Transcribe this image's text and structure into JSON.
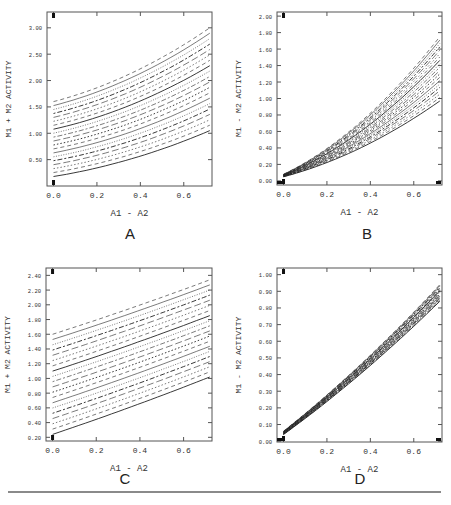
{
  "figure": {
    "panels": [
      "A",
      "B",
      "C",
      "D"
    ]
  },
  "chart_data": [
    {
      "id": "A",
      "type": "line",
      "title": "A",
      "xlabel": "A1 - A2",
      "ylabel": "M1 + M2 ACTIVITY",
      "xlim": [
        -0.03,
        0.73
      ],
      "ylim": [
        0.0,
        3.3
      ],
      "xticks": [
        0.0,
        0.2,
        0.4,
        0.6
      ],
      "xtick_labels": [
        "0.0",
        "0.2",
        "0.4",
        "0.6"
      ],
      "yticks": [
        0.5,
        1.0,
        1.5,
        2.0,
        2.5,
        3.0
      ],
      "ytick_labels": [
        "0.50",
        "1.00",
        "1.50",
        "2.00",
        "2.50",
        "3.00"
      ],
      "x": [
        0.0,
        0.1,
        0.2,
        0.3,
        0.4,
        0.5,
        0.6,
        0.72
      ],
      "family": {
        "count": 20,
        "y0_start": 0.18,
        "y0_end": 1.6,
        "y1_start": 1.05,
        "y1_end": 3.0,
        "curvature": "convex"
      },
      "series_note": "family of ~20 curves (solid, dashed, dotted) rising from y≈0.18–1.60 at x=0 to y≈1.05–3.00 at x=0.72",
      "grid": false
    },
    {
      "id": "B",
      "type": "line",
      "title": "B",
      "xlabel": "A1 - A2",
      "ylabel": "M1 - M2 ACTIVITY",
      "xlim": [
        -0.03,
        0.73
      ],
      "ylim": [
        -0.05,
        2.05
      ],
      "xticks": [
        0.0,
        0.2,
        0.4,
        0.6
      ],
      "xtick_labels": [
        "0.0",
        "0.2",
        "0.4",
        "0.6"
      ],
      "yticks": [
        0.0,
        0.2,
        0.4,
        0.6,
        0.8,
        1.0,
        1.2,
        1.4,
        1.6,
        1.8,
        2.0
      ],
      "ytick_labels": [
        "0.00",
        "0.20",
        "0.40",
        "0.60",
        "0.80",
        "1.00",
        "1.20",
        "1.40",
        "1.60",
        "1.80",
        "2.00"
      ],
      "family": {
        "count": 20,
        "y0_start": 0.05,
        "y0_end": 0.08,
        "y1_start": 0.97,
        "y1_end": 1.75,
        "curvature": "convex"
      },
      "series_note": "fan of ~20 curves from y≈0.05 at x=0 spreading to y≈0.97–1.75 at x=0.72",
      "grid": false
    },
    {
      "id": "C",
      "type": "line",
      "title": "C",
      "xlabel": "A1 - A2",
      "ylabel": "M1 + M2 ACTIVITY",
      "xlim": [
        -0.03,
        0.73
      ],
      "ylim": [
        0.15,
        2.5
      ],
      "xticks": [
        0.0,
        0.2,
        0.4,
        0.6
      ],
      "xtick_labels": [
        "0.0",
        "0.2",
        "0.4",
        "0.6"
      ],
      "yticks": [
        0.2,
        0.4,
        0.6,
        0.8,
        1.0,
        1.2,
        1.4,
        1.6,
        1.8,
        2.0,
        2.2,
        2.4
      ],
      "ytick_labels": [
        "0.20",
        "0.40",
        "0.60",
        "0.80",
        "1.00",
        "1.20",
        "1.40",
        "1.60",
        "1.80",
        "2.00",
        "2.20",
        "2.40"
      ],
      "family": {
        "count": 20,
        "y0_start": 0.24,
        "y0_end": 1.6,
        "y1_start": 1.02,
        "y1_end": 2.34,
        "curvature": "near-linear"
      },
      "series_note": "family of ~20 near-linear curves from y≈0.24–1.60 at x=0 to y≈1.02–2.34 at x=0.72",
      "grid": false
    },
    {
      "id": "D",
      "type": "line",
      "title": "D",
      "xlabel": "A1 - A2",
      "ylabel": "M1 - M2 ACTIVITY",
      "xlim": [
        -0.03,
        0.73
      ],
      "ylim": [
        -0.005,
        1.04
      ],
      "xticks": [
        0.0,
        0.2,
        0.4,
        0.6
      ],
      "xtick_labels": [
        "0.0",
        "0.2",
        "0.4",
        "0.6"
      ],
      "yticks": [
        0.0,
        0.1,
        0.2,
        0.3,
        0.4,
        0.5,
        0.6,
        0.7,
        0.8,
        0.9,
        1.0
      ],
      "ytick_labels": [
        "0.00",
        "0.10",
        "0.20",
        "0.30",
        "0.40",
        "0.50",
        "0.60",
        "0.70",
        "0.80",
        "0.90",
        "1.00"
      ],
      "family": {
        "count": 20,
        "y0_start": 0.04,
        "y0_end": 0.06,
        "y1_start": 0.84,
        "y1_end": 0.94,
        "curvature": "slight"
      },
      "series_note": "narrow band of ~20 near-linear curves from y≈0.04–0.06 at x=0 to y≈0.84–0.94 at x=0.72",
      "grid": false
    }
  ]
}
